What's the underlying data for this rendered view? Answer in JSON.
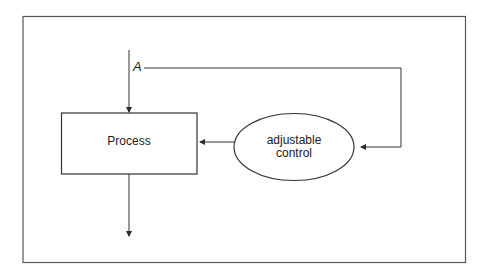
{
  "diagram": {
    "type": "feedback-control-loop",
    "nodes": {
      "process": {
        "label": "Process"
      },
      "control": {
        "label_line1": "adjustable",
        "label_line2": "control"
      }
    },
    "edge_labels": {
      "input": "A"
    },
    "edges": [
      {
        "from": "input",
        "to": "process",
        "label": "A"
      },
      {
        "from": "input-tap-A",
        "to": "control"
      },
      {
        "from": "control",
        "to": "process"
      },
      {
        "from": "process",
        "to": "output"
      }
    ],
    "colors": {
      "stroke": "#3a3a3a",
      "text": "#1a1a1a",
      "background": "#ffffff"
    }
  }
}
